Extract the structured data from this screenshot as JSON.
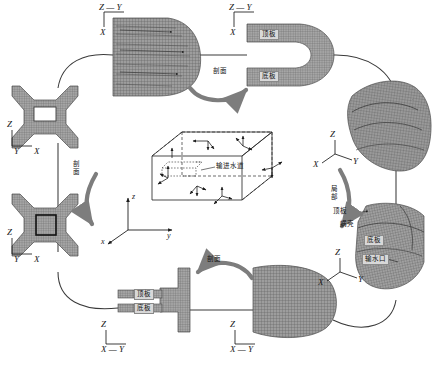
{
  "figure": {
    "background": "#ffffff",
    "mesh_fill": "#9a9a9a",
    "mesh_line": "#4a4a4a",
    "arrow_color": "#7a7a7a",
    "line_color": "#3a3a3a"
  },
  "process_labels": [
    {
      "id": "top",
      "text": "剖面",
      "meaning": "cross-section",
      "orientation": "horizontal"
    },
    {
      "id": "left",
      "text": "剖面",
      "meaning": "cross-section",
      "orientation": "vertical"
    },
    {
      "id": "bottom",
      "text": "剖面",
      "meaning": "cross-section",
      "orientation": "horizontal"
    },
    {
      "id": "right",
      "text": "局部",
      "meaning": "local detail",
      "orientation": "vertical"
    }
  ],
  "views": [
    {
      "id": "top-left",
      "name": "half-runner-section-mesh",
      "axes": {
        "vertical": "Z",
        "horizontal_top": "Y",
        "horizontal_left": "Z",
        "below": "X",
        "style": "Z-Y-over-X"
      },
      "axis_text": {
        "top": "Z — Y",
        "bottom": "X"
      },
      "labels": []
    },
    {
      "id": "top-right",
      "name": "u-channel-section-mesh",
      "axis_text": {
        "top": "Z — Y",
        "bottom": "X"
      },
      "labels": [
        {
          "text": "顶板",
          "meaning": "top plate",
          "boxed": true
        },
        {
          "text": "底板",
          "meaning": "bottom plate",
          "boxed": true
        }
      ]
    },
    {
      "id": "right-upper",
      "name": "full-3d-spiral-case-mesh",
      "axis_text": {
        "top": "Z",
        "left": "X",
        "right": "Y"
      },
      "labels": []
    },
    {
      "id": "right-lower",
      "name": "local-detail-3d-mesh",
      "axis_text": {
        "top": "Z",
        "left": "X",
        "right": "Y"
      },
      "labels": [
        {
          "text": "顶板",
          "meaning": "top plate",
          "boxed": false
        },
        {
          "text": "蜗壳",
          "meaning": "spiral casing",
          "boxed": false
        },
        {
          "text": "底板",
          "meaning": "bottom plate",
          "boxed": true
        },
        {
          "text": "输水口",
          "meaning": "water passage",
          "boxed": true
        }
      ]
    },
    {
      "id": "bottom-right",
      "name": "block-section-mesh",
      "axis_text": {
        "top": "Z",
        "bottom": "X — Y"
      },
      "labels": []
    },
    {
      "id": "bottom-left",
      "name": "t-shaped-plate-section-mesh",
      "axis_text": {
        "top": "Z",
        "bottom": "X — Y"
      },
      "labels": [
        {
          "text": "顶板",
          "meaning": "top plate",
          "boxed": true
        },
        {
          "text": "底板",
          "meaning": "bottom plate",
          "boxed": true
        }
      ]
    },
    {
      "id": "left-upper",
      "name": "cross-plan-mesh-with-hole",
      "axis_text": {
        "top": "Z",
        "left": "Y",
        "right": "X"
      },
      "labels": []
    },
    {
      "id": "left-lower",
      "name": "cross-plan-mesh-with-detail-box",
      "axis_text": {
        "top": "Z",
        "left": "Y",
        "right": "X"
      },
      "labels": []
    }
  ],
  "center_schematic": {
    "name": "boundary-condition-box",
    "callout": {
      "text": "输进水道",
      "meaning": "inlet water passage"
    },
    "axes": {
      "z": "z",
      "y": "y",
      "x": "x"
    },
    "arrow_groups": 7,
    "description": "wireframe hexahedral block with dashed hidden edges and restraint arrow triads on faces"
  }
}
